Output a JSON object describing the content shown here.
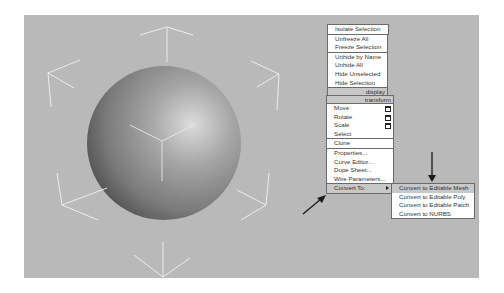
{
  "viewport": {
    "background": "#b9b9b9",
    "object": "sphere"
  },
  "quad_menu_display": {
    "header": "display",
    "items": [
      {
        "label": "Isolate Selection"
      },
      {
        "label": "Unfreeze All"
      },
      {
        "label": "Freeze Selection"
      },
      {
        "label": "Unhide by Name"
      },
      {
        "label": "Unhide All"
      },
      {
        "label": "Hide Unselected"
      },
      {
        "label": "Hide Selection"
      }
    ]
  },
  "quad_menu_transform": {
    "header": "transform",
    "items": [
      {
        "label": "Move",
        "icon": "settings-box-icon"
      },
      {
        "label": "Rotate",
        "icon": "settings-box-icon"
      },
      {
        "label": "Scale",
        "icon": "settings-box-icon"
      },
      {
        "label": "Select"
      },
      {
        "label": "Clone"
      },
      {
        "label": "Properties..."
      },
      {
        "label": "Curve Editor..."
      },
      {
        "label": "Dope Sheet..."
      },
      {
        "label": "Wire Parameters..."
      },
      {
        "label": "Convert To:",
        "icon": "submenu-arrow-icon"
      }
    ]
  },
  "convert_submenu": {
    "items": [
      {
        "label": "Convert to Editable Mesh"
      },
      {
        "label": "Convert to Editable Poly"
      },
      {
        "label": "Convert to Editable Patch"
      },
      {
        "label": "Convert to NURBS"
      }
    ]
  },
  "annotations": {
    "arrow_color": "#1a1a1a",
    "arrows": [
      "down-arrow-to-editable-mesh",
      "diagonal-arrow-to-convert-to"
    ]
  }
}
